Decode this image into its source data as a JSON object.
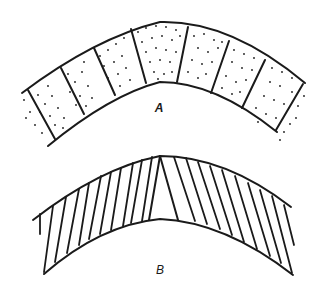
{
  "figure": {
    "ink_color": "#1a1a1a",
    "background": "#ffffff",
    "panels": [
      {
        "id": "A",
        "label": "A",
        "description": "Curved band divided into radial blocks, stippled fill",
        "fill_pattern": "stipple",
        "block_count": 7
      },
      {
        "id": "B",
        "label": "B",
        "description": "Curved band with oblique hatching fanning from a central apex",
        "fill_pattern": "hatch",
        "hatch_left_count": 11,
        "hatch_right_count": 10
      }
    ]
  }
}
